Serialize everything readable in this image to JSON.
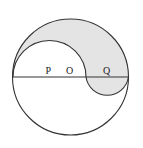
{
  "diagram": {
    "labels": {
      "P": "P",
      "O": "O",
      "Q": "Q"
    },
    "colors": {
      "stroke": "#333333",
      "shade": "#e4e4e4",
      "background": "#ffffff"
    },
    "geometry": {
      "outer_circle": {
        "cx": 70.5,
        "cy": 77,
        "r": 58
      },
      "upper_semicircle": {
        "center": "P",
        "cx": 49.5,
        "cy": 77,
        "r": 36.5
      },
      "lower_semicircle": {
        "center": "Q",
        "cx": 107.5,
        "cy": 77,
        "r": 21.5
      },
      "diameter_y": 77
    },
    "shaded_region": "region between outer upper arc, upper semicircle on P, and lower semicircle on Q"
  }
}
